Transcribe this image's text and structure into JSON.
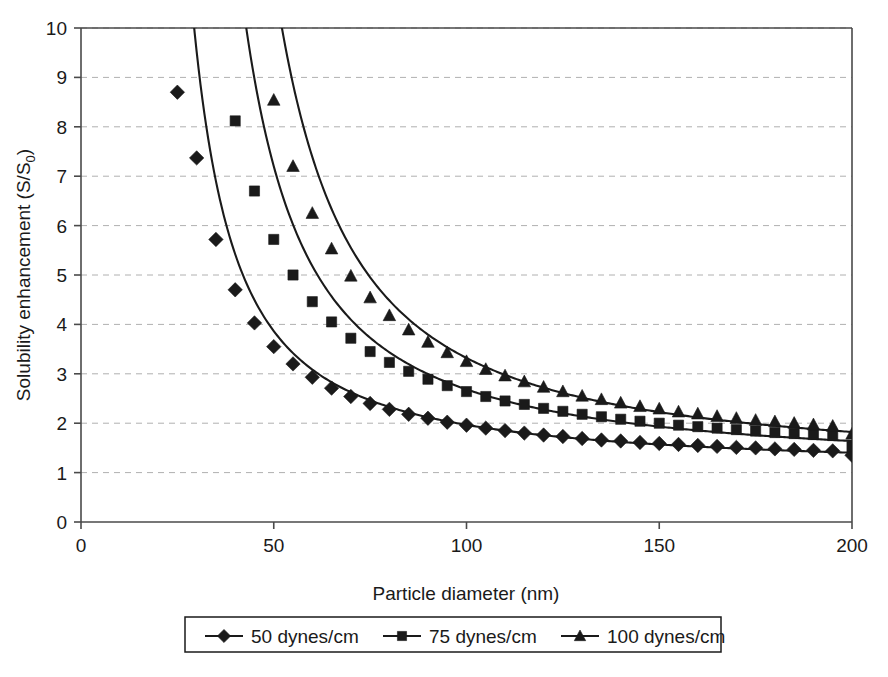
{
  "chart_data": {
    "type": "line",
    "title": "",
    "subtitle": "",
    "xlabel": "Particle diameter (nm)",
    "ylabel": "Solubility enhancement (S/S",
    "ylabel_sub": "0",
    "ylabel_close": ")",
    "xlim": [
      0,
      200
    ],
    "ylim": [
      0,
      10
    ],
    "xticks": [
      0,
      50,
      100,
      150,
      200
    ],
    "xtick_labels": [
      "0",
      "50",
      "100",
      "150",
      "200"
    ],
    "yticks": [
      0,
      1,
      2,
      3,
      4,
      5,
      6,
      7,
      8,
      9,
      10
    ],
    "ytick_labels": [
      "0",
      "1",
      "2",
      "3",
      "4",
      "5",
      "6",
      "7",
      "8",
      "9",
      "10"
    ],
    "grid": {
      "horizontal": true,
      "vertical": false,
      "style": "dashed",
      "color": "#b0b0b0"
    },
    "legend": {
      "position": "bottom",
      "boxed": true,
      "entries": [
        {
          "label": "50 dynes/cm",
          "marker": "diamond",
          "color": "#1a1a1a"
        },
        {
          "label": "75 dynes/cm",
          "marker": "square",
          "color": "#1a1a1a"
        },
        {
          "label": "100 dynes/cm",
          "marker": "triangle",
          "color": "#1a1a1a"
        }
      ]
    },
    "x": [
      25,
      30,
      35,
      40,
      45,
      50,
      55,
      60,
      65,
      70,
      75,
      80,
      85,
      90,
      95,
      100,
      105,
      110,
      115,
      120,
      125,
      130,
      135,
      140,
      145,
      150,
      155,
      160,
      165,
      170,
      175,
      180,
      185,
      190,
      195,
      200
    ],
    "series": [
      {
        "name": "50 dynes/cm",
        "marker": "diamond",
        "color": "#1a1a1a",
        "surface_tension": 50,
        "units": "dynes/cm",
        "values": [
          8.7,
          7.37,
          5.72,
          4.7,
          4.03,
          3.55,
          3.2,
          2.93,
          2.71,
          2.54,
          2.4,
          2.28,
          2.18,
          2.1,
          2.02,
          1.96,
          1.9,
          1.85,
          1.8,
          1.76,
          1.73,
          1.69,
          1.66,
          1.64,
          1.61,
          1.59,
          1.57,
          1.55,
          1.53,
          1.51,
          1.5,
          1.48,
          1.47,
          1.45,
          1.44,
          1.35
        ]
      },
      {
        "name": "75 dynes/cm",
        "marker": "square",
        "color": "#1a1a1a",
        "surface_tension": 75,
        "units": "dynes/cm",
        "values": [
          20.0,
          14.0,
          10.2,
          8.12,
          6.7,
          5.72,
          5.0,
          4.46,
          4.05,
          3.72,
          3.45,
          3.23,
          3.05,
          2.89,
          2.76,
          2.64,
          2.54,
          2.45,
          2.38,
          2.3,
          2.24,
          2.18,
          2.13,
          2.08,
          2.04,
          2.0,
          1.96,
          1.93,
          1.9,
          1.87,
          1.84,
          1.81,
          1.79,
          1.77,
          1.75,
          1.52
        ]
      },
      {
        "name": "100 dynes/cm",
        "marker": "triangle",
        "color": "#1a1a1a",
        "surface_tension": 100,
        "units": "dynes/cm",
        "values": [
          48.0,
          28.0,
          18.5,
          13.4,
          10.5,
          8.54,
          7.2,
          6.25,
          5.53,
          4.98,
          4.54,
          4.18,
          3.89,
          3.64,
          3.43,
          3.25,
          3.09,
          2.96,
          2.84,
          2.73,
          2.64,
          2.55,
          2.48,
          2.41,
          2.34,
          2.29,
          2.23,
          2.19,
          2.14,
          2.1,
          2.06,
          2.03,
          2.0,
          1.97,
          1.94,
          1.78
        ]
      }
    ],
    "annotations": []
  }
}
